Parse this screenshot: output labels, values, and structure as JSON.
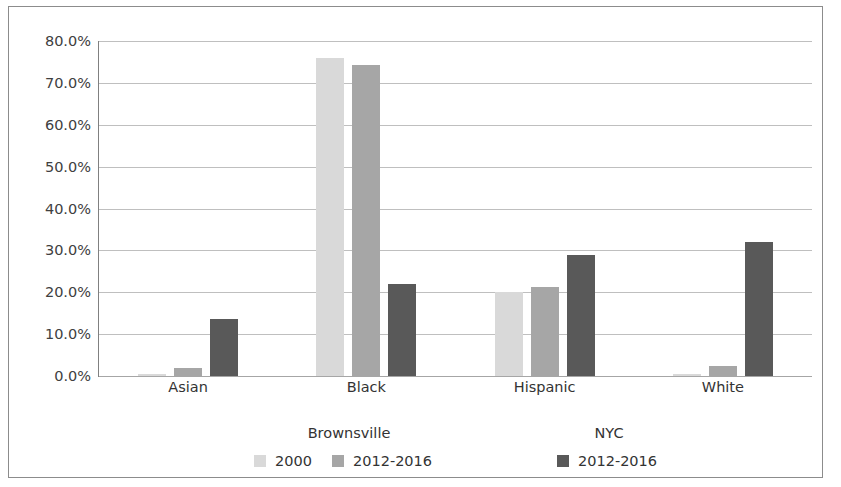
{
  "chart_data": {
    "type": "bar",
    "title": "",
    "xlabel": "",
    "ylabel": "",
    "ylim": [
      0,
      0.8
    ],
    "grid": true,
    "legend_position": "bottom",
    "categories": [
      "Asian",
      "Black",
      "Hispanic",
      "White"
    ],
    "y_tick_labels": [
      "80.0%",
      "70.0%",
      "60.0%",
      "50.0%",
      "40.0%",
      "30.0%",
      "20.0%",
      "10.0%",
      "0.0%"
    ],
    "y_tick_values": [
      80.0,
      70.0,
      60.0,
      50.0,
      40.0,
      30.0,
      20.0,
      10.0,
      0.0
    ],
    "series": [
      {
        "name": "2000",
        "group": "Brownsville",
        "color": "#d9d9d9",
        "values": [
          0.5,
          76.0,
          20.0,
          0.5
        ]
      },
      {
        "name": "2012-2016",
        "group": "Brownsville",
        "color": "#a6a6a6",
        "values": [
          1.8,
          74.3,
          21.2,
          2.3
        ]
      },
      {
        "name": "2012-2016",
        "group": "NYC",
        "color": "#595959",
        "values": [
          13.5,
          22.0,
          29.0,
          32.0
        ]
      }
    ],
    "legend": {
      "groups": [
        {
          "title": "Brownsville"
        },
        {
          "title": "NYC"
        }
      ],
      "entries": [
        {
          "label": "2000",
          "color": "#d9d9d9"
        },
        {
          "label": "2012-2016",
          "color": "#a6a6a6"
        },
        {
          "label": "2012-2016",
          "color": "#595959"
        }
      ]
    }
  }
}
